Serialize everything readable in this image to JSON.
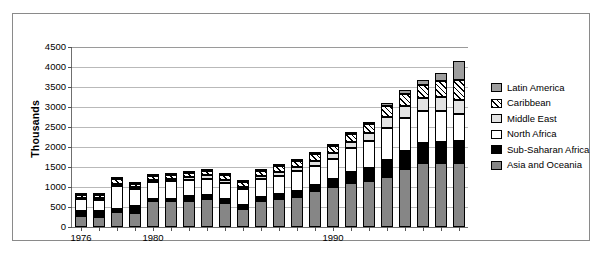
{
  "chart_data": {
    "type": "bar",
    "title": "",
    "xlabel": "",
    "ylabel": "Thousands",
    "stacked": true,
    "ylim": [
      0,
      4500
    ],
    "ytick_step": 500,
    "grid": true,
    "legend_position": "right",
    "yticks": [
      "0",
      "500",
      "1000",
      "1500",
      "2000",
      "2500",
      "3000",
      "3500",
      "4000",
      "4500"
    ],
    "categories": [
      "1976",
      "1977",
      "1978",
      "1979",
      "1980",
      "1981",
      "1982",
      "1983",
      "1984",
      "1985",
      "1986",
      "1987",
      "1988",
      "1989",
      "1990",
      "1991",
      "1992",
      "1993",
      "1994",
      "1995",
      "1996",
      "1997"
    ],
    "xtick_labels": [
      {
        "category": "1976",
        "label": "1976"
      },
      {
        "category": "1980",
        "label": "1980"
      },
      {
        "category": "1990",
        "label": "1990"
      }
    ],
    "series": [
      {
        "name": "Asia and Oceania",
        "swatch": "asia",
        "color": "#868686",
        "values": [
          270,
          260,
          380,
          360,
          640,
          640,
          660,
          700,
          590,
          440,
          640,
          700,
          760,
          900,
          1000,
          1100,
          1150,
          1250,
          1450,
          1600,
          1600,
          1600
        ]
      },
      {
        "name": "Sub-Saharan Africa",
        "swatch": "ssa",
        "color": "#000000",
        "values": [
          130,
          140,
          70,
          170,
          60,
          60,
          110,
          110,
          110,
          100,
          100,
          120,
          130,
          150,
          190,
          280,
          330,
          420,
          460,
          500,
          520,
          560
        ]
      },
      {
        "name": "North Africa",
        "swatch": "na",
        "color": "#ffffff",
        "values": [
          290,
          280,
          580,
          420,
          420,
          440,
          400,
          400,
          400,
          400,
          450,
          460,
          500,
          480,
          520,
          600,
          680,
          800,
          820,
          800,
          780,
          660
        ]
      },
      {
        "name": "Middle East",
        "swatch": "me",
        "color": "#e2e2e2",
        "values": [
          40,
          40,
          50,
          50,
          60,
          60,
          70,
          80,
          80,
          70,
          90,
          100,
          110,
          120,
          130,
          150,
          180,
          280,
          300,
          320,
          340,
          350
        ]
      },
      {
        "name": "Caribbean",
        "swatch": "carib",
        "color": "#ffffff",
        "values": [
          70,
          70,
          130,
          80,
          100,
          100,
          110,
          120,
          120,
          110,
          130,
          140,
          150,
          170,
          180,
          200,
          230,
          280,
          300,
          330,
          420,
          500
        ]
      },
      {
        "name": "Latin America",
        "swatch": "latin",
        "color": "#9e9e9e",
        "values": [
          20,
          20,
          30,
          20,
          20,
          20,
          20,
          20,
          20,
          20,
          20,
          20,
          20,
          20,
          20,
          30,
          40,
          60,
          90,
          130,
          200,
          480
        ]
      }
    ]
  }
}
